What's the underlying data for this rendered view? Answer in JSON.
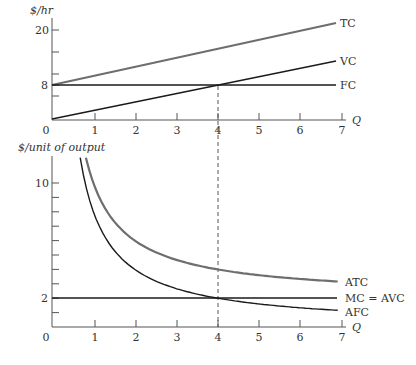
{
  "chart_data": [
    {
      "type": "line",
      "title": "",
      "ylabel": "$/hr",
      "xlabel": "Q",
      "xlim": [
        0,
        7
      ],
      "ylim": [
        0,
        22
      ],
      "x_ticks": [
        "0",
        "1",
        "2",
        "3",
        "4",
        "5",
        "6",
        "7"
      ],
      "y_tick_labels": [
        {
          "value": 20,
          "label": "20"
        },
        {
          "value": 8,
          "label": "8"
        }
      ],
      "series": [
        {
          "name": "TC",
          "x": [
            0,
            7
          ],
          "values": [
            8,
            22
          ],
          "color": "#6e6e6e"
        },
        {
          "name": "VC",
          "x": [
            0,
            7
          ],
          "values": [
            0,
            14
          ],
          "color": "#1a1a1a"
        },
        {
          "name": "FC",
          "x": [
            0,
            7
          ],
          "values": [
            8,
            8
          ],
          "color": "#1a1a1a"
        }
      ],
      "annotations": [
        {
          "type": "dashed-vline",
          "x": 4,
          "from_y": 8
        }
      ]
    },
    {
      "type": "line",
      "title": "",
      "ylabel": "$/unit of output",
      "xlabel": "Q",
      "xlim": [
        0,
        7
      ],
      "ylim": [
        0,
        12
      ],
      "x_ticks": [
        "0",
        "1",
        "2",
        "3",
        "4",
        "5",
        "6",
        "7"
      ],
      "y_tick_labels": [
        {
          "value": 10,
          "label": "10"
        },
        {
          "value": 2,
          "label": "2"
        }
      ],
      "series": [
        {
          "name": "ATC",
          "x": [
            0.82,
            1,
            2,
            3,
            4,
            5,
            6,
            7
          ],
          "values": [
            11.7,
            10,
            6,
            4.67,
            4,
            3.6,
            3.33,
            3.14
          ],
          "color": "#6e6e6e"
        },
        {
          "name": "MC = AVC",
          "x": [
            0,
            7
          ],
          "values": [
            2,
            2
          ],
          "color": "#1a1a1a"
        },
        {
          "name": "AFC",
          "x": [
            0.68,
            1,
            2,
            3,
            4,
            5,
            6,
            7
          ],
          "values": [
            11.7,
            8,
            4,
            2.67,
            2,
            1.6,
            1.33,
            1.14
          ],
          "color": "#1a1a1a"
        }
      ],
      "annotations": [
        {
          "type": "dashed-vline",
          "x": 4
        }
      ]
    }
  ],
  "labels": {
    "top_ylabel": "$/hr",
    "bottom_ylabel": "$/unit of output",
    "q": "Q",
    "zero": "0",
    "tc": "TC",
    "vc": "VC",
    "fc": "FC",
    "atc": "ATC",
    "mc_avc": "MC = AVC",
    "afc": "AFC",
    "y20": "20",
    "y8": "8",
    "y10": "10",
    "y2": "2",
    "x": [
      "1",
      "2",
      "3",
      "4",
      "5",
      "6",
      "7"
    ]
  }
}
